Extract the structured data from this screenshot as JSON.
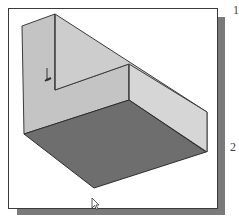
{
  "figure": {
    "type": "isometric-3d-model-view",
    "colors": {
      "background": "#ffffff",
      "frame_border": "#3a3a3a",
      "frame_shadow": "#7a7a7a",
      "wall_face": "#c8c8c8",
      "right_wall_face": "#d4d4d4",
      "floor_face": "#6e6e6e",
      "edge_line": "#3c3c3c"
    },
    "coordinate_icon": "ucs-axis-icon",
    "cursor": "mouse-pointer-icon"
  },
  "side_labels": {
    "top": "1",
    "middle": "2"
  }
}
